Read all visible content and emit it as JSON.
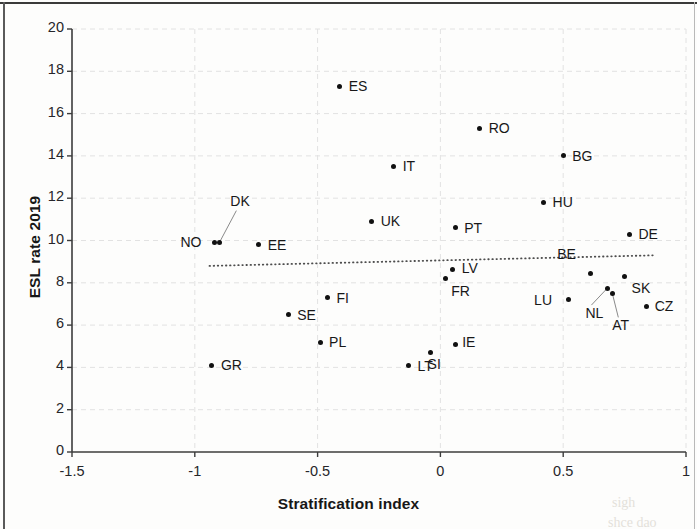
{
  "figure": {
    "background_color": "#fdfdfc",
    "marker_color": "#111111",
    "trendline_color": "#4d4d4d",
    "gridline_color": "#e2e2e2",
    "axis_color": "#3c3c3c"
  },
  "chart_data": {
    "type": "scatter",
    "title": "",
    "xlabel": "Stratification index",
    "ylabel": "ESL rate 2019",
    "xlim": [
      -1.5,
      1
    ],
    "ylim": [
      0,
      20
    ],
    "xticks": [
      "-1.5",
      "-1",
      "-0.5",
      "0",
      "0.5",
      "1"
    ],
    "xtick_values": [
      -1.5,
      -1,
      -0.5,
      0,
      0.5,
      1
    ],
    "yticks": [
      "0",
      "2",
      "4",
      "6",
      "8",
      "10",
      "12",
      "14",
      "16",
      "18",
      "20"
    ],
    "ytick_values": [
      0,
      2,
      4,
      6,
      8,
      10,
      12,
      14,
      16,
      18,
      20
    ],
    "grid": true,
    "legend": "none",
    "points": [
      {
        "label": "GR",
        "x": -0.93,
        "y": 4.1,
        "label_dx": 9,
        "label_dy": -8
      },
      {
        "label": "NO",
        "x": -0.92,
        "y": 9.9,
        "label_dx": -34,
        "label_dy": -9
      },
      {
        "label": "DK",
        "x": -0.9,
        "y": 9.9,
        "label_dx": 11,
        "label_dy": -50,
        "leader": true
      },
      {
        "label": "SE",
        "x": -0.62,
        "y": 6.5,
        "label_dx": 9,
        "label_dy": -8
      },
      {
        "label": "EE",
        "x": -0.74,
        "y": 9.8,
        "label_dx": 9,
        "label_dy": -8
      },
      {
        "label": "FI",
        "x": -0.46,
        "y": 7.3,
        "label_dx": 9,
        "label_dy": -8
      },
      {
        "label": "PL",
        "x": -0.49,
        "y": 5.2,
        "label_dx": 9,
        "label_dy": -8
      },
      {
        "label": "ES",
        "x": -0.41,
        "y": 17.3,
        "label_dx": 9,
        "label_dy": -8
      },
      {
        "label": "UK",
        "x": -0.28,
        "y": 10.9,
        "label_dx": 9,
        "label_dy": -8
      },
      {
        "label": "IT",
        "x": -0.19,
        "y": 13.5,
        "label_dx": 9,
        "label_dy": -8
      },
      {
        "label": "LT",
        "x": -0.13,
        "y": 4.1,
        "label_dx": 9,
        "label_dy": -7
      },
      {
        "label": "SI",
        "x": -0.04,
        "y": 4.7,
        "label_dx": -3,
        "label_dy": 3
      },
      {
        "label": "IE",
        "x": 0.06,
        "y": 5.1,
        "label_dx": 7,
        "label_dy": -10
      },
      {
        "label": "FR",
        "x": 0.02,
        "y": 8.2,
        "label_dx": 6,
        "label_dy": 4
      },
      {
        "label": "LV",
        "x": 0.05,
        "y": 8.65,
        "label_dx": 9,
        "label_dy": -9
      },
      {
        "label": "PT",
        "x": 0.06,
        "y": 10.6,
        "label_dx": 9,
        "label_dy": -8
      },
      {
        "label": "RO",
        "x": 0.16,
        "y": 15.3,
        "label_dx": 9,
        "label_dy": -8
      },
      {
        "label": "HU",
        "x": 0.42,
        "y": 11.8,
        "label_dx": 9,
        "label_dy": -8
      },
      {
        "label": "BG",
        "x": 0.5,
        "y": 14.0,
        "label_dx": 9,
        "label_dy": -8
      },
      {
        "label": "LU",
        "x": 0.52,
        "y": 7.2,
        "label_dx": -34,
        "label_dy": -8
      },
      {
        "label": "BE",
        "x": 0.61,
        "y": 8.45,
        "label_dx": -33,
        "label_dy": -27
      },
      {
        "label": "NL",
        "x": 0.68,
        "y": 7.75,
        "label_dx": -22,
        "label_dy": 17,
        "leader": true
      },
      {
        "label": "AT",
        "x": 0.7,
        "y": 7.5,
        "label_dx": 0,
        "label_dy": 24,
        "leader": true
      },
      {
        "label": "SK",
        "x": 0.75,
        "y": 8.3,
        "label_dx": 7,
        "label_dy": 4
      },
      {
        "label": "DE",
        "x": 0.77,
        "y": 10.3,
        "label_dx": 9,
        "label_dy": -8
      },
      {
        "label": "CZ",
        "x": 0.84,
        "y": 6.9,
        "label_dx": 8,
        "label_dy": -8
      }
    ],
    "trendline": {
      "style": "dotted",
      "x_start": -0.94,
      "y_start": 8.8,
      "x_end": 0.87,
      "y_end": 9.3
    }
  },
  "artifacts": {
    "ghost_right_1": "sigh",
    "ghost_right_2": "shce dao"
  }
}
